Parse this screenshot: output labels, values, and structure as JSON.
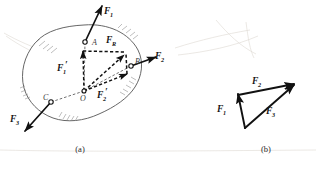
{
  "figure": {
    "title_caption_a": "(a)",
    "title_caption_b": "(b)",
    "colors": {
      "ink": "#111111",
      "outline": "#555555",
      "hatch": "#888888",
      "ghost": "#ded9d2",
      "background": "#ffffff"
    }
  },
  "panel_a": {
    "caption": "(a)",
    "description": "rigid-body with three applied forces and parallelogram of resolved components at O",
    "points": [
      {
        "id": "A",
        "label": "A",
        "x": 85,
        "y": 42
      },
      {
        "id": "B",
        "label": "B",
        "x": 131,
        "y": 66
      },
      {
        "id": "C",
        "label": "C",
        "x": 51,
        "y": 102
      },
      {
        "id": "O",
        "label": "O",
        "x": 84,
        "y": 91
      }
    ],
    "forces": [
      {
        "id": "F1",
        "base": "F",
        "sub": "1",
        "label_x": 108,
        "label_y": 13
      },
      {
        "id": "F2",
        "base": "F",
        "sub": "2",
        "label_x": 158,
        "label_y": 58
      },
      {
        "id": "F3",
        "base": "F",
        "sub": "3",
        "label_x": 14,
        "label_y": 121
      },
      {
        "id": "F1p",
        "base": "F",
        "sub": "1",
        "prime": true,
        "label_x": 60,
        "label_y": 70
      },
      {
        "id": "F2p",
        "base": "F",
        "sub": "2",
        "prime": true,
        "label_x": 100,
        "label_y": 97
      },
      {
        "id": "FR",
        "base": "F",
        "sub": "R",
        "label_x": 110,
        "label_y": 42
      }
    ]
  },
  "panel_b": {
    "caption": "(b)",
    "description": "closed force triangle of the same three forces",
    "vertices": [
      {
        "id": "tail",
        "x": 244,
        "y": 127
      },
      {
        "id": "top_left",
        "x": 238,
        "y": 94
      },
      {
        "id": "right",
        "x": 293,
        "y": 85
      }
    ],
    "forces": [
      {
        "id": "F1",
        "base": "F",
        "sub": "1",
        "label_x": 221,
        "label_y": 111
      },
      {
        "id": "F2",
        "base": "F",
        "sub": "2",
        "label_x": 256,
        "label_y": 83
      },
      {
        "id": "F3",
        "base": "F",
        "sub": "3",
        "label_x": 270,
        "label_y": 113
      }
    ]
  }
}
